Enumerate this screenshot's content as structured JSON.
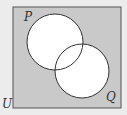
{
  "diagram": {
    "type": "venn",
    "universe_label": "U",
    "sets": [
      {
        "label": "P",
        "cx": 55,
        "cy": 42,
        "r": 28
      },
      {
        "label": "Q",
        "cx": 82,
        "cy": 71,
        "r": 27
      }
    ],
    "shaded_region": "complement of P union Q",
    "colors": {
      "shade": "#c9c9c9",
      "background": "#ececec",
      "circle_fill": "#ffffff",
      "stroke": "#333333"
    }
  }
}
